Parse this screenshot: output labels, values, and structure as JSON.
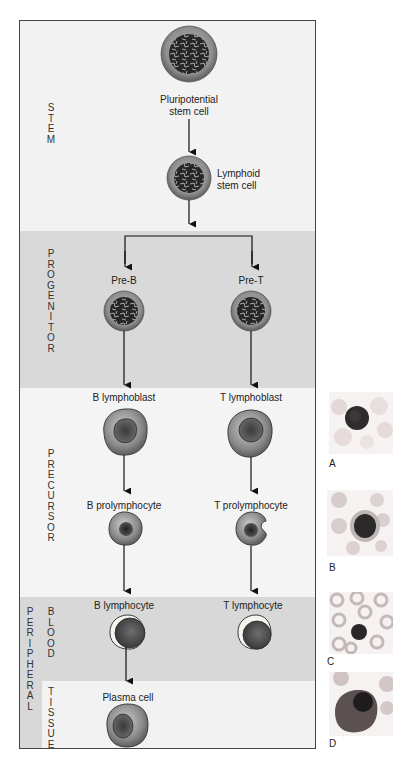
{
  "figure": {
    "stages": {
      "stem": "STEM",
      "progenitor": "PROGENITOR",
      "precursor": "PRECURSOR",
      "peripheral": "PERIPHERAL",
      "blood": "BLOOD",
      "tissue": "TISSUE"
    },
    "cells": {
      "pluripotential_line1": "Pluripotential",
      "pluripotential_line2": "stem cell",
      "lymphoid_line1": "Lymphoid",
      "lymphoid_line2": "stem cell",
      "pre_b": "Pre-B",
      "pre_t": "Pre-T",
      "b_lymphoblast": "B lymphoblast",
      "t_lymphoblast": "T lymphoblast",
      "b_prolymphocyte": "B prolymphocyte",
      "t_prolymphocyte": "T prolymphocyte",
      "b_lymphocyte": "B lymphocyte",
      "t_lymphocyte": "T lymphocyte",
      "plasma_cell": "Plasma cell"
    },
    "photo_panels": [
      "A",
      "B",
      "C",
      "D"
    ],
    "colors": {
      "stem_band": "#f2f2f2",
      "progenitor_band": "#d9d9d9",
      "precursor_band": "#f4f4f4",
      "blood_band": "#d8d8d8",
      "tissue_band": "#f2f2f2",
      "cell_cytoplasm": "#8c8c8c",
      "nucleus": "#2b2b2b"
    }
  }
}
